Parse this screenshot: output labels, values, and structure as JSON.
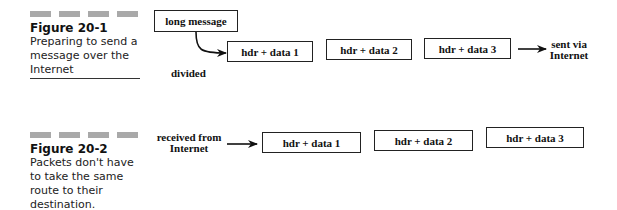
{
  "figure1": {
    "number": "Figure 20-1",
    "caption": "Preparing to send a message over the Internet",
    "source_label": "long message",
    "divided_label": "divided",
    "packets": [
      "hdr + data 1",
      "hdr + data 2",
      "hdr + data 3"
    ],
    "destination_label": "sent via Internet"
  },
  "figure2": {
    "number": "Figure 20-2",
    "caption": "Packets don't have to take the same route to their destination.",
    "source_label": "received from Internet",
    "packets": [
      "hdr + data 1",
      "hdr + data 2",
      "hdr + data 3"
    ]
  },
  "colors": {
    "bar": "#a9a9a9",
    "stroke": "#222222"
  }
}
